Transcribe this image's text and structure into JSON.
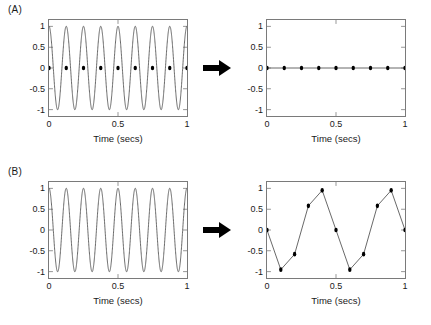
{
  "figure": {
    "background_color": "#ffffff",
    "axis_color": "#7a7a7a",
    "line_color": "#555555",
    "marker_color": "#000000",
    "arrow_color": "#000000"
  },
  "panels": [
    {
      "label": "(A)",
      "arrow_icon": "right-arrow-icon",
      "left_plot": {
        "xlabel": "Time (secs)",
        "xticks": [
          "0",
          "0.5",
          "1"
        ],
        "xtick_values": [
          0,
          0.5,
          1
        ],
        "yticks": [
          "1",
          "0.5",
          "0",
          "-0.5",
          "-1"
        ],
        "ytick_values": [
          1,
          0.5,
          0,
          -0.5,
          -1
        ]
      },
      "right_plot": {
        "xlabel": "Time (secs)",
        "xticks": [
          "0",
          "0.5",
          "1"
        ],
        "xtick_values": [
          0,
          0.5,
          1
        ],
        "yticks": [
          "1",
          "0.5",
          "0",
          "-0.5",
          "-1"
        ],
        "ytick_values": [
          1,
          0.5,
          0,
          -0.5,
          -1
        ]
      }
    },
    {
      "label": "(B)",
      "arrow_icon": "right-arrow-icon",
      "left_plot": {
        "xlabel": "Time (secs)",
        "xticks": [
          "0",
          "0.5",
          "1"
        ],
        "xtick_values": [
          0,
          0.5,
          1
        ],
        "yticks": [
          "1",
          "0.5",
          "0",
          "-0.5",
          "-1"
        ],
        "ytick_values": [
          1,
          0.5,
          0,
          -0.5,
          -1
        ]
      },
      "right_plot": {
        "xlabel": "Time (secs)",
        "xticks": [
          "0",
          "0.5",
          "1"
        ],
        "xtick_values": [
          0,
          0.5,
          1
        ],
        "yticks": [
          "1",
          "0.5",
          "0",
          "-0.5",
          "-1"
        ],
        "ytick_values": [
          1,
          0.5,
          0,
          -0.5,
          -1
        ]
      }
    }
  ],
  "chart_data": [
    {
      "id": "a-left",
      "type": "line",
      "title": "",
      "xlabel": "Time (secs)",
      "ylabel": "",
      "xlim": [
        0,
        1
      ],
      "ylim": [
        -1.15,
        1.15
      ],
      "grid": false,
      "legend": "none",
      "series": [
        {
          "name": "continuous-sine-8hz",
          "kind": "continuous",
          "description": "sin wave, 8 cycles over 1 second, starting at +1 (cosine phase)",
          "frequency_hz": 8,
          "amplitude": 1,
          "phase": "cosine"
        },
        {
          "name": "samples",
          "kind": "markers",
          "x": [
            0,
            0.125,
            0.25,
            0.375,
            0.5,
            0.625,
            0.75,
            0.875,
            1
          ],
          "y": [
            0,
            0,
            0,
            0,
            0,
            0,
            0,
            0,
            0
          ]
        }
      ]
    },
    {
      "id": "a-right",
      "type": "line",
      "title": "",
      "xlabel": "Time (secs)",
      "ylabel": "",
      "xlim": [
        0,
        1
      ],
      "ylim": [
        -1.15,
        1.15
      ],
      "grid": false,
      "legend": "none",
      "series": [
        {
          "name": "reconstructed-signal",
          "kind": "line-markers",
          "x": [
            0,
            0.125,
            0.25,
            0.375,
            0.5,
            0.625,
            0.75,
            0.875,
            1
          ],
          "y": [
            0,
            0,
            0,
            0,
            0,
            0,
            0,
            0,
            0
          ]
        }
      ]
    },
    {
      "id": "b-left",
      "type": "line",
      "title": "",
      "xlabel": "Time (secs)",
      "ylabel": "",
      "xlim": [
        0,
        1
      ],
      "ylim": [
        -1.15,
        1.15
      ],
      "grid": false,
      "legend": "none",
      "series": [
        {
          "name": "continuous-cosine-8hz",
          "kind": "continuous",
          "description": "cosine wave, 8 cycles over 1 second, starting at +1",
          "frequency_hz": 8,
          "amplitude": 1,
          "phase": "cosine"
        }
      ]
    },
    {
      "id": "b-right",
      "type": "line",
      "title": "",
      "xlabel": "Time (secs)",
      "ylabel": "",
      "xlim": [
        0,
        1
      ],
      "ylim": [
        -1.15,
        1.15
      ],
      "grid": false,
      "legend": "none",
      "series": [
        {
          "name": "aliased-signal",
          "kind": "line-markers",
          "x": [
            0,
            0.1,
            0.2,
            0.3,
            0.4,
            0.5,
            0.6,
            0.7,
            0.8,
            0.9,
            1
          ],
          "y": [
            0,
            -0.95,
            -0.58,
            0.58,
            0.95,
            0,
            -0.95,
            -0.58,
            0.58,
            0.95,
            0
          ]
        }
      ]
    }
  ]
}
